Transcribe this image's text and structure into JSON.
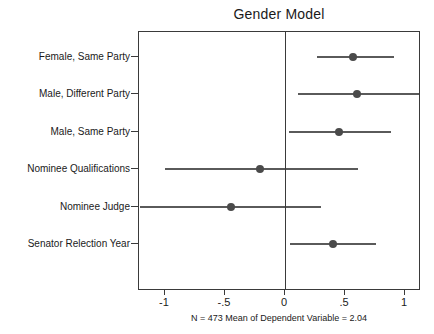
{
  "chart_data": {
    "type": "scatter",
    "title": "Gender Model",
    "subtitle": "",
    "xlabel": "",
    "ylabel": "",
    "note": "N = 473 Mean of Dependent Variable = 2.04",
    "xlim": [
      -1.21,
      1.14
    ],
    "xticks": [
      -1,
      -0.5,
      0,
      0.5,
      1
    ],
    "xticklabels": [
      "-1",
      "-.5",
      "0",
      ".5",
      "1"
    ],
    "grid": false,
    "legend": null,
    "reference_line": 0,
    "categories": [
      "Female, Same Party",
      "Male, Different Party",
      "Male, Same Party",
      "Nominee Qualifications",
      "Nominee Judge",
      "Senator Relection Year"
    ],
    "series": [
      {
        "name": "Coefficient estimate with confidence interval",
        "points": [
          {
            "category": "Female, Same Party",
            "estimate": 0.57,
            "ci_low": 0.27,
            "ci_high": 0.91
          },
          {
            "category": "Male, Different Party",
            "estimate": 0.6,
            "ci_low": 0.11,
            "ci_high": 1.12
          },
          {
            "category": "Male, Same Party",
            "estimate": 0.45,
            "ci_low": 0.03,
            "ci_high": 0.88
          },
          {
            "category": "Nominee Qualifications",
            "estimate": -0.21,
            "ci_low": -1.0,
            "ci_high": 0.61
          },
          {
            "category": "Nominee Judge",
            "estimate": -0.45,
            "ci_low": -1.21,
            "ci_high": 0.3
          },
          {
            "category": "Senator Relection Year",
            "estimate": 0.4,
            "ci_low": 0.04,
            "ci_high": 0.76
          }
        ]
      }
    ],
    "colors": {
      "marker": "#4a4a4a",
      "interval": "#5a5a5a",
      "axis": "#3a3a3a",
      "text": "#1a1a1a",
      "background": "#ffffff"
    }
  }
}
